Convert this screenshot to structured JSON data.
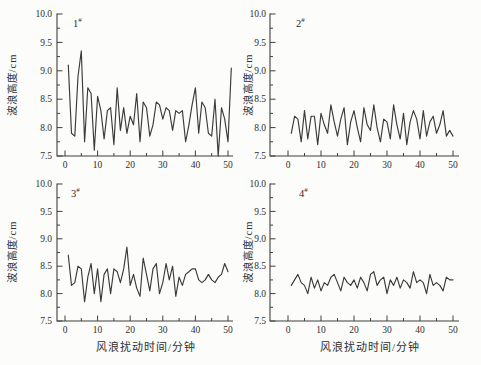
{
  "figure": {
    "bg_color": "#fcfcfa",
    "line_color": "#3a3a3a",
    "axis_color": "#3f3f3f",
    "text_color": "#2e2e2e"
  },
  "chart_data": [
    {
      "type": "line",
      "label": "1",
      "label_suffix": "#",
      "ylabel": "波浪高度/cm",
      "ylim": [
        7.5,
        10.0
      ],
      "y_ticks": [
        7.5,
        8.0,
        8.5,
        9.0,
        9.5,
        10.0
      ],
      "y_minor_step": 0.25,
      "x_ticks": [
        0,
        10,
        20,
        30,
        40,
        50
      ],
      "x_minor_step": 5,
      "x_start": 1,
      "x_step": 1,
      "values": [
        9.1,
        7.9,
        7.85,
        8.9,
        9.35,
        7.75,
        8.7,
        8.6,
        7.6,
        8.55,
        8.3,
        7.8,
        8.3,
        8.35,
        7.7,
        8.7,
        7.95,
        8.35,
        7.9,
        8.2,
        8.05,
        8.6,
        7.75,
        8.45,
        8.35,
        7.85,
        8.05,
        8.45,
        8.4,
        8.15,
        8.35,
        8.3,
        7.95,
        8.3,
        8.25,
        8.3,
        7.75,
        8.05,
        8.4,
        8.7,
        7.9,
        8.45,
        8.35,
        7.9,
        7.85,
        8.5,
        7.5,
        8.35,
        8.15,
        7.75,
        9.05
      ]
    },
    {
      "type": "line",
      "label": "2",
      "label_suffix": "#",
      "ylabel": "波浪高度/cm",
      "ylim": [
        7.5,
        10.0
      ],
      "y_ticks": [
        7.5,
        8.0,
        8.5,
        9.0,
        9.5,
        10.0
      ],
      "y_minor_step": 0.25,
      "x_ticks": [
        0,
        10,
        20,
        30,
        40,
        50
      ],
      "x_minor_step": 5,
      "x_start": 1,
      "x_step": 1,
      "values": [
        7.9,
        8.2,
        8.15,
        7.75,
        8.3,
        7.8,
        8.2,
        8.2,
        7.7,
        8.25,
        8.05,
        7.9,
        8.4,
        8.1,
        7.85,
        8.15,
        8.35,
        7.7,
        8.1,
        8.3,
        8.0,
        7.75,
        8.35,
        8.05,
        7.95,
        8.4,
        8.0,
        7.75,
        8.15,
        8.1,
        7.8,
        8.4,
        8.05,
        7.8,
        8.25,
        7.7,
        8.1,
        8.3,
        8.15,
        7.8,
        8.3,
        7.85,
        8.1,
        8.2,
        7.9,
        8.05,
        8.3,
        7.85,
        7.95,
        7.85
      ]
    },
    {
      "type": "line",
      "label": "3",
      "label_suffix": "#",
      "xlabel": "风浪扰动时间/分钟",
      "ylabel": "波浪高度/cm",
      "ylim": [
        7.5,
        10.0
      ],
      "y_ticks": [
        7.5,
        8.0,
        8.5,
        9.0,
        9.5,
        10.0
      ],
      "y_minor_step": 0.25,
      "x_ticks": [
        0,
        10,
        20,
        30,
        40,
        50
      ],
      "x_minor_step": 5,
      "x_start": 1,
      "x_step": 1,
      "values": [
        8.7,
        8.15,
        8.2,
        8.5,
        8.45,
        7.85,
        8.3,
        8.55,
        8.0,
        8.45,
        7.85,
        8.35,
        8.45,
        8.0,
        8.45,
        8.4,
        8.2,
        8.45,
        8.85,
        8.15,
        8.35,
        8.1,
        7.95,
        8.65,
        8.35,
        8.05,
        8.45,
        8.55,
        8.0,
        8.2,
        8.55,
        8.25,
        8.5,
        7.95,
        8.3,
        8.15,
        8.35,
        8.4,
        8.45,
        8.45,
        8.25,
        8.2,
        8.25,
        8.35,
        8.25,
        8.2,
        8.3,
        8.35,
        8.55,
        8.4
      ]
    },
    {
      "type": "line",
      "label": "4",
      "label_suffix": "#",
      "xlabel": "风浪扰动时间/分钟",
      "ylabel": "波浪高度/cm",
      "ylim": [
        7.5,
        10.0
      ],
      "y_ticks": [
        7.5,
        8.0,
        8.5,
        9.0,
        9.5,
        10.0
      ],
      "y_minor_step": 0.25,
      "x_ticks": [
        0,
        10,
        20,
        30,
        40,
        50
      ],
      "x_minor_step": 5,
      "x_start": 1,
      "x_step": 1,
      "values": [
        8.15,
        8.25,
        8.35,
        8.2,
        8.15,
        8.0,
        8.3,
        8.1,
        8.25,
        8.05,
        8.2,
        8.15,
        8.3,
        8.35,
        8.2,
        8.05,
        8.3,
        8.2,
        8.15,
        8.25,
        8.1,
        8.3,
        8.2,
        8.05,
        8.35,
        8.4,
        8.15,
        8.25,
        8.3,
        8.0,
        8.25,
        8.15,
        8.3,
        8.1,
        8.25,
        8.2,
        8.1,
        8.4,
        8.2,
        8.25,
        8.2,
        8.0,
        8.35,
        8.15,
        8.2,
        8.15,
        8.05,
        8.3,
        8.25,
        8.25
      ]
    }
  ]
}
